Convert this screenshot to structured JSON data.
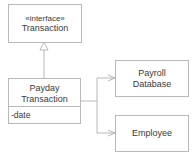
{
  "diagram": {
    "type": "uml-class-diagram",
    "classes": [
      {
        "id": "transaction",
        "stereotype": "«interface»",
        "name": "Transaction",
        "attributes": []
      },
      {
        "id": "payday",
        "name_line1": "Payday",
        "name_line2": "Transaction",
        "attributes": [
          "-date"
        ]
      },
      {
        "id": "payroll_db",
        "name_line1": "Payroll",
        "name_line2": "Database"
      },
      {
        "id": "employee",
        "name": "Employee"
      }
    ],
    "relations": [
      {
        "from": "payday",
        "to": "transaction",
        "kind": "realization"
      },
      {
        "from": "payday",
        "to": "payroll_db",
        "kind": "association"
      },
      {
        "from": "payday",
        "to": "employee",
        "kind": "association"
      }
    ],
    "colors": {
      "line": "#b8b8b8",
      "text": "#3a3a3a",
      "background": "#ffffff"
    }
  }
}
